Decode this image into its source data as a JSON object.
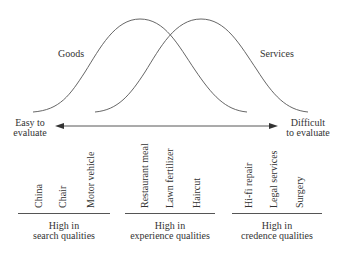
{
  "diagram": {
    "curves": [
      {
        "name": "Goods",
        "label": "Goods"
      },
      {
        "name": "Services",
        "label": "Services"
      }
    ],
    "axis": {
      "left_label_line1": "Easy to",
      "left_label_line2": "evaluate",
      "right_label_line1": "Difficult",
      "right_label_line2": "to evaluate"
    },
    "groups": [
      {
        "heading_line1": "High in",
        "heading_line2": "search qualities",
        "items": [
          "China",
          "Chair",
          "Motor vehicle"
        ]
      },
      {
        "heading_line1": "High in",
        "heading_line2": "experience qualities",
        "items": [
          "Restaurant meal",
          "Lawn fertilizer",
          "Haircut"
        ]
      },
      {
        "heading_line1": "High in",
        "heading_line2": "credence qualities",
        "items": [
          "Hi-fi repair",
          "Legal services",
          "Surgery"
        ]
      }
    ],
    "colors": {
      "line": "#555555",
      "text": "#333333"
    }
  }
}
